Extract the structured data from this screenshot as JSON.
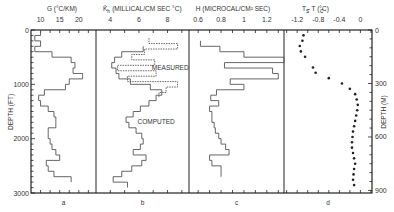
{
  "chart_data": {
    "type": "line",
    "layout": {
      "panels": 4,
      "shared_y": true,
      "grid": false,
      "legend": "none",
      "y_inverted": true
    },
    "y_left": {
      "label": "DEPTH (FT)",
      "ticks": [
        0,
        1000,
        2000,
        3000
      ],
      "range": [
        0,
        3000
      ]
    },
    "y_right": {
      "label": "DEPTH (M)",
      "ticks": [
        0,
        300,
        600,
        900
      ],
      "range": [
        0,
        914
      ]
    },
    "panels": [
      {
        "id": "a",
        "letter": "a",
        "xlabel": "G (°C/KM)",
        "xticks": [
          10,
          15,
          20
        ],
        "xrange": [
          7.5,
          24.5
        ],
        "series": [
          {
            "name": "G",
            "style": "step-solid",
            "depth_ft": [
              50,
              150,
              250,
              350,
              450,
              550,
              650,
              750,
              850,
              950,
              1050,
              1150,
              1250,
              1350,
              1450,
              1550,
              1650,
              1750,
              1850,
              1950,
              2050,
              2150,
              2250,
              2350,
              2450,
              2550,
              2650,
              2750
            ],
            "values": [
              10,
              8.5,
              10,
              8.5,
              13,
              18,
              19,
              18.5,
              21,
              17.5,
              16.5,
              11,
              9.5,
              10,
              12,
              13.5,
              14,
              14,
              12,
              12,
              12.5,
              13,
              14,
              15,
              11.5,
              12,
              13.5,
              18
            ]
          }
        ]
      },
      {
        "id": "b",
        "letter": "b",
        "xlabel": "K̄h (MILLICAL/CM SEC °C)",
        "xticks": [
          4,
          6,
          8
        ],
        "xrange": [
          3.0,
          9.5
        ],
        "annotations": [
          {
            "text": "MEASURED",
            "depth_ft": 700,
            "x": 6.9
          },
          {
            "text": "COMPUTED",
            "depth_ft": 1700,
            "x": 5.9
          }
        ],
        "series": [
          {
            "name": "Measured",
            "style": "step-dashed",
            "depth_ft": [
              200,
              300,
              400,
              500,
              600,
              700,
              800,
              900,
              1000,
              1100,
              1200
            ],
            "values": [
              6.7,
              8.7,
              6.4,
              5.5,
              7.1,
              4.5,
              7.2,
              5.2,
              8.7,
              7.9,
              7.4
            ]
          },
          {
            "name": "Computed",
            "style": "step-solid",
            "depth_ft": [
              350,
              450,
              550,
              650,
              750,
              850,
              950,
              1050,
              1150,
              1250,
              1350,
              1450,
              1550,
              1650,
              1750,
              1850,
              1950,
              2050,
              2150,
              2250,
              2350,
              2450,
              2550,
              2650,
              2750,
              2850
            ],
            "values": [
              6.3,
              4.8,
              4.3,
              4.1,
              4.4,
              4.6,
              5.4,
              6.8,
              7.6,
              7.2,
              6.7,
              6.1,
              5.6,
              5.1,
              5.3,
              5.8,
              6.2,
              6.3,
              6.1,
              5.6,
              6.5,
              6.2,
              5.5,
              4.8,
              4.2,
              5.2
            ]
          }
        ]
      },
      {
        "id": "c",
        "letter": "c",
        "xlabel": "H (MICROCAL/CM² SEC)",
        "xticks": [
          0.6,
          0.8,
          1.0,
          1.2
        ],
        "xrange": [
          0.52,
          1.35
        ],
        "series": [
          {
            "name": "H",
            "style": "step-solid",
            "depth_ft": [
              250,
              350,
              450,
              550,
              650,
              750,
              850,
              950,
              1050,
              1150,
              1250,
              1350,
              1450,
              1550,
              1650,
              1750,
              1850,
              1950,
              2050,
              2150,
              2250,
              2350,
              2450,
              2550,
              2650
            ],
            "values": [
              0.62,
              0.79,
              1.0,
              1.35,
              0.83,
              1.25,
              1.3,
              0.88,
              1.0,
              0.76,
              0.71,
              0.78,
              0.7,
              0.72,
              0.72,
              0.74,
              0.75,
              0.78,
              0.8,
              0.84,
              0.87,
              0.7,
              0.72,
              0.8,
              0.8
            ]
          }
        ]
      },
      {
        "id": "d",
        "letter": "d",
        "xlabel": "Ts - Tc (°C)",
        "xticks": [
          -1.2,
          -0.8,
          -0.4,
          0
        ],
        "xrange": [
          -1.45,
          0.22
        ],
        "series": [
          {
            "name": "Ts-Tc",
            "style": "dots",
            "depth_m": [
              30,
              60,
              90,
              120,
              150,
              210,
              240,
              270,
              300,
              330,
              360,
              390,
              420,
              450,
              480,
              510,
              540,
              570,
              600,
              630,
              660,
              690,
              720,
              750,
              780,
              810,
              840,
              870
            ],
            "values": [
              -1.08,
              -1.1,
              -1.15,
              -1.13,
              -1.05,
              -0.9,
              -0.85,
              -0.6,
              -0.35,
              -0.2,
              -0.1,
              -0.07,
              -0.05,
              -0.06,
              -0.08,
              -0.1,
              -0.12,
              -0.14,
              -0.15,
              -0.16,
              -0.16,
              -0.14,
              -0.12,
              -0.1,
              -0.12,
              -0.13,
              -0.14,
              -0.12
            ]
          }
        ]
      }
    ]
  },
  "labels": {
    "depth_ft_title": "DEPTH (FT)",
    "depth_m_title": "DEPTH (M)",
    "panel_a_title": "G (°C/KM)",
    "panel_b_title_k": "K̄",
    "panel_b_title_sub": "h",
    "panel_b_title_rest": "(MILLICAL/CM SEC °C)",
    "panel_c_title": "H (MICROCAL/CM² SEC)",
    "panel_d_title": "T  - T  (°C)",
    "panel_d_title_s": "s",
    "panel_d_title_c": "c",
    "measured": "MEASURED",
    "computed": "COMPUTED"
  },
  "colors": {
    "line": "#555555",
    "frame": "#222222",
    "dots": "#222222",
    "background": "#ffffff"
  }
}
